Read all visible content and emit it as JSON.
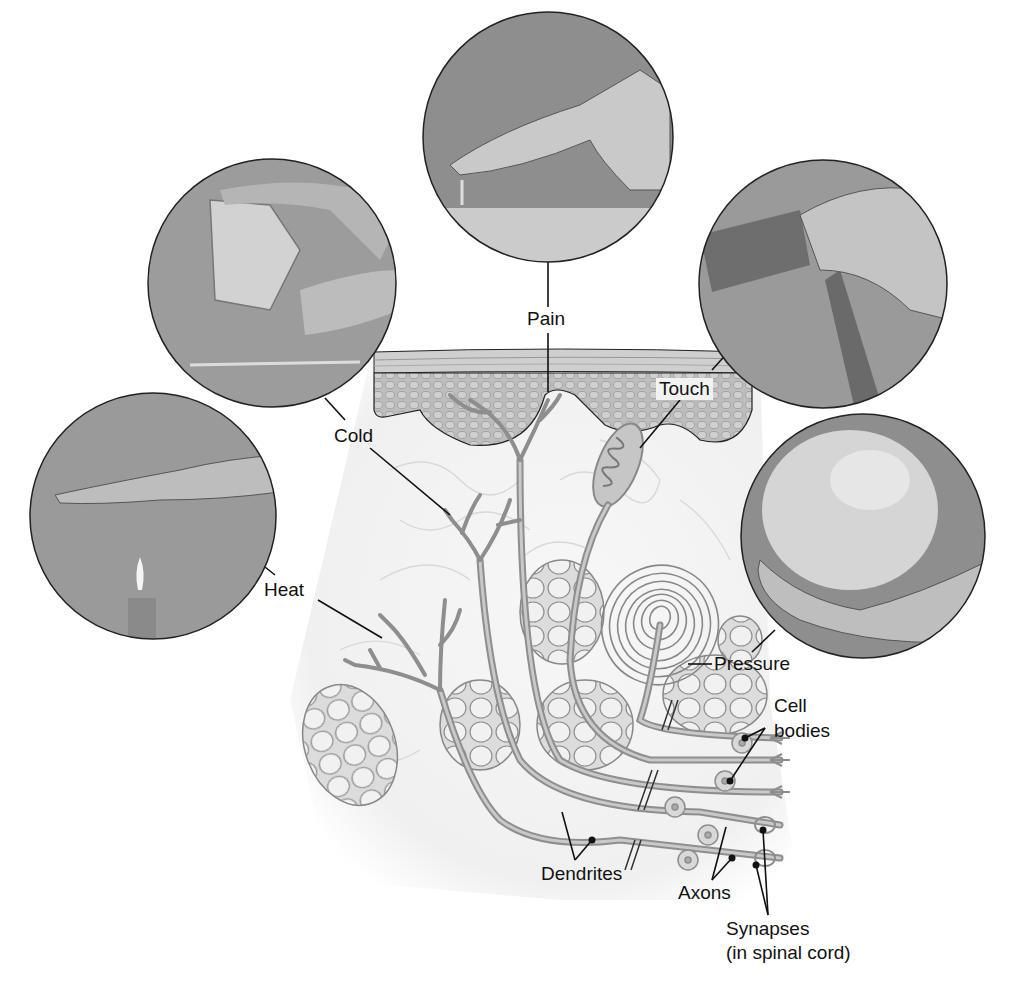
{
  "diagram": {
    "stimuli": [
      {
        "id": "pain",
        "label": "Pain",
        "photo": "finger pressing tack"
      },
      {
        "id": "cold",
        "label": "Cold",
        "photo": "fingers holding ice cube over glass"
      },
      {
        "id": "heat",
        "label": "Heat",
        "photo": "hand held above candle flame"
      },
      {
        "id": "touch",
        "label": "Touch",
        "photo": "fingers rubbing fabric"
      },
      {
        "id": "pressure",
        "label": "Pressure",
        "photo": "hand holding heavy ball"
      }
    ],
    "structure_labels": {
      "cell_bodies": "Cell\nbodies",
      "cell_bodies_line1": "Cell",
      "cell_bodies_line2": "bodies",
      "dendrites": "Dendrites",
      "axons": "Axons",
      "synapses_line1": "Synapses",
      "synapses_line2": "(in spinal cord)"
    },
    "colors": {
      "photo_bg": "#9a9a9a",
      "nerve": "#8e8e8e",
      "nerve_fill": "#c4c4c4",
      "epidermis": "#b9b9b9",
      "fat_cells": "#e8e8e8",
      "outline": "#222222"
    }
  }
}
